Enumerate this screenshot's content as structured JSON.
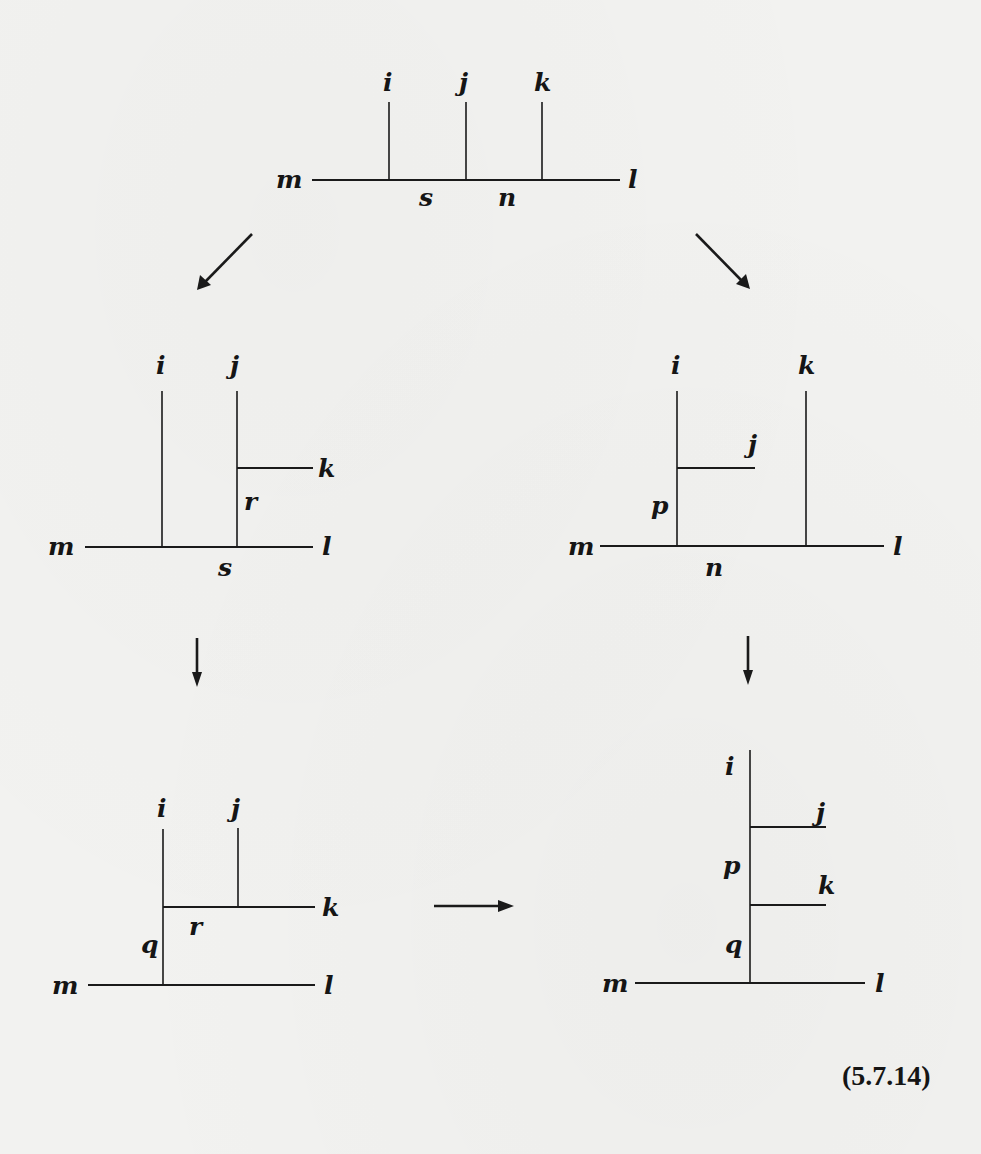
{
  "figure": {
    "equation_number": "(5.7.14)",
    "diagrams": [
      {
        "id": "top",
        "position": "top-center",
        "external_labels": [
          "i",
          "j",
          "k",
          "m",
          "l"
        ],
        "internal_labels": [
          "s",
          "n"
        ],
        "labels": {
          "i": "i",
          "j": "j",
          "k": "k",
          "m": "m",
          "l": "l",
          "s": "s",
          "n": "n"
        }
      },
      {
        "id": "middle-left",
        "position": "middle-left",
        "labels": {
          "i": "i",
          "j": "j",
          "k": "k",
          "r": "r",
          "m": "m",
          "l": "l",
          "s": "s"
        }
      },
      {
        "id": "middle-right",
        "position": "middle-right",
        "labels": {
          "i": "i",
          "k": "k",
          "j": "j",
          "p": "p",
          "m": "m",
          "l": "l",
          "n": "n"
        }
      },
      {
        "id": "bottom-left",
        "position": "bottom-left",
        "labels": {
          "i": "i",
          "j": "j",
          "k": "k",
          "r": "r",
          "q": "q",
          "m": "m",
          "l": "l"
        }
      },
      {
        "id": "bottom-right",
        "position": "bottom-right",
        "labels": {
          "i": "i",
          "j": "j",
          "p": "p",
          "k": "k",
          "q": "q",
          "m": "m",
          "l": "l"
        }
      }
    ],
    "arrows": [
      {
        "from": "top",
        "to": "middle-left",
        "direction": "down-left"
      },
      {
        "from": "top",
        "to": "middle-right",
        "direction": "down-right"
      },
      {
        "from": "middle-left",
        "to": "bottom-left",
        "direction": "down"
      },
      {
        "from": "middle-right",
        "to": "bottom-right",
        "direction": "down"
      },
      {
        "from": "bottom-left",
        "to": "bottom-right",
        "direction": "right"
      }
    ]
  }
}
